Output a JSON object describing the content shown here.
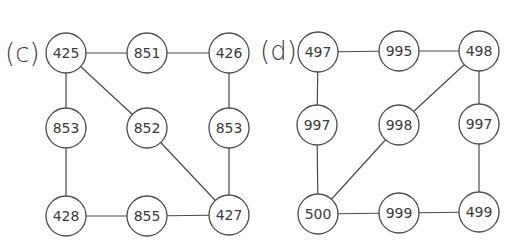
{
  "panels": [
    {
      "label": "(c)",
      "label_pos": [
        5,
        53
      ],
      "nodes": [
        {
          "id": "c0",
          "value": "425",
          "x": 66,
          "y": 53
        },
        {
          "id": "c1",
          "value": "851",
          "x": 147,
          "y": 53
        },
        {
          "id": "c2",
          "value": "426",
          "x": 229,
          "y": 53
        },
        {
          "id": "c3",
          "value": "853",
          "x": 66,
          "y": 128
        },
        {
          "id": "c4",
          "value": "852",
          "x": 147,
          "y": 128
        },
        {
          "id": "c5",
          "value": "853",
          "x": 229,
          "y": 128
        },
        {
          "id": "c6",
          "value": "428",
          "x": 66,
          "y": 216
        },
        {
          "id": "c7",
          "value": "855",
          "x": 147,
          "y": 216
        },
        {
          "id": "c8",
          "value": "427",
          "x": 229,
          "y": 215
        }
      ],
      "edges": [
        [
          "c0",
          "c1"
        ],
        [
          "c1",
          "c2"
        ],
        [
          "c0",
          "c3"
        ],
        [
          "c0",
          "c4"
        ],
        [
          "c2",
          "c5"
        ],
        [
          "c3",
          "c6"
        ],
        [
          "c4",
          "c8"
        ],
        [
          "c5",
          "c8"
        ],
        [
          "c6",
          "c7"
        ],
        [
          "c7",
          "c8"
        ]
      ]
    },
    {
      "label": "(d)",
      "label_pos": [
        260,
        51
      ],
      "nodes": [
        {
          "id": "d0",
          "value": "497",
          "x": 318,
          "y": 52
        },
        {
          "id": "d1",
          "value": "995",
          "x": 399,
          "y": 51
        },
        {
          "id": "d2",
          "value": "498",
          "x": 479,
          "y": 51
        },
        {
          "id": "d3",
          "value": "997",
          "x": 317,
          "y": 125
        },
        {
          "id": "d4",
          "value": "998",
          "x": 399,
          "y": 125
        },
        {
          "id": "d5",
          "value": "997",
          "x": 479,
          "y": 124
        },
        {
          "id": "d6",
          "value": "500",
          "x": 318,
          "y": 214
        },
        {
          "id": "d7",
          "value": "999",
          "x": 399,
          "y": 213
        },
        {
          "id": "d8",
          "value": "499",
          "x": 479,
          "y": 212
        }
      ],
      "edges": [
        [
          "d0",
          "d1"
        ],
        [
          "d1",
          "d2"
        ],
        [
          "d0",
          "d3"
        ],
        [
          "d2",
          "d5"
        ],
        [
          "d2",
          "d4"
        ],
        [
          "d4",
          "d6"
        ],
        [
          "d3",
          "d6"
        ],
        [
          "d5",
          "d8"
        ],
        [
          "d6",
          "d7"
        ],
        [
          "d7",
          "d8"
        ]
      ]
    }
  ],
  "style": {
    "node_radius": 20,
    "stroke_color": "#4a4a4a",
    "text_color": "#3a3a3a",
    "background": "#ffffff"
  }
}
